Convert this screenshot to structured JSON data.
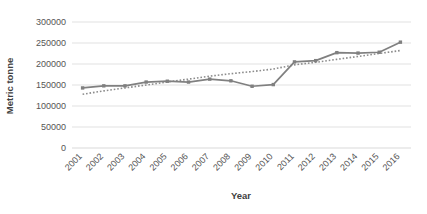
{
  "chart_data": {
    "type": "line",
    "title": "",
    "xlabel": "Year",
    "ylabel": "Metric tonne",
    "categories": [
      "2001",
      "2002",
      "2003",
      "2004",
      "2005",
      "2006",
      "2007",
      "2008",
      "2009",
      "2010",
      "2011",
      "2012",
      "2013",
      "2014",
      "2015",
      "2016"
    ],
    "x_tick_labels": [
      "2001",
      "2002",
      "2003",
      "2004",
      "2005",
      "2006",
      "2007",
      "2008",
      "2009",
      "2010",
      "2011",
      "2012",
      "2013",
      "2014",
      "2015",
      "2016"
    ],
    "y_tick_labels": [
      "0",
      "50000",
      "100000",
      "150000",
      "200000",
      "250000",
      "300000"
    ],
    "y_ticks": [
      0,
      50000,
      100000,
      150000,
      200000,
      250000,
      300000
    ],
    "ylim": [
      0,
      300000
    ],
    "grid": "horizontal",
    "legend": "none",
    "series": [
      {
        "name": "Production",
        "style": "solid",
        "marker": "square",
        "color": "#808080",
        "values": [
          143000,
          148000,
          148000,
          157000,
          159000,
          157000,
          164000,
          160000,
          147000,
          151000,
          205000,
          208000,
          227000,
          226000,
          228000,
          252000
        ]
      },
      {
        "name": "Trend",
        "style": "dotted",
        "marker": "none",
        "color": "#8c8c8c",
        "values": [
          128000,
          136000,
          143000,
          150000,
          157000,
          164000,
          171000,
          177000,
          182000,
          188000,
          198000,
          204000,
          211000,
          218000,
          225000,
          232000
        ]
      }
    ],
    "colors": {
      "series_line": "#808080",
      "trend_line": "#8c8c8c",
      "gridline": "#d9d9d9",
      "tick_text": "#555555",
      "axis_title": "#3f3f3f",
      "background": "#ffffff"
    }
  },
  "labels": {
    "y_axis_title": "Metric tonne",
    "x_axis_title": "Year"
  }
}
